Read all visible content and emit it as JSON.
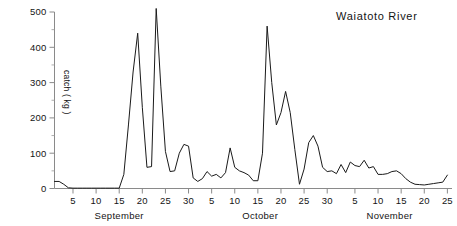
{
  "chart_data": {
    "type": "line",
    "title": "Waiatoto River",
    "xlabel": "",
    "ylabel": "catch ( kg )",
    "ylim": [
      0,
      500
    ],
    "yticks": [
      0,
      100,
      200,
      300,
      400,
      500
    ],
    "yticklabels": [
      "0",
      "100",
      "200",
      "300",
      "400",
      "500"
    ],
    "yminor_step": 50,
    "grid": false,
    "legend": null,
    "months": [
      {
        "name": "September",
        "days": 30
      },
      {
        "name": "October",
        "days": 31
      },
      {
        "name": "November",
        "days": 25
      }
    ],
    "xticklabels_september": [
      "5",
      "10",
      "15",
      "20",
      "25",
      "30"
    ],
    "xticklabels_october": [
      "5",
      "10",
      "15",
      "20",
      "25",
      "30"
    ],
    "xticklabels_november": [
      "5",
      "10",
      "15",
      "20",
      "25"
    ],
    "xtick_step_days": 5,
    "series": [
      {
        "name": "catch",
        "x": [
          1,
          2,
          3,
          4,
          5,
          6,
          7,
          8,
          9,
          10,
          11,
          12,
          13,
          14,
          15,
          16,
          17,
          18,
          19,
          20,
          21,
          22,
          23,
          24,
          25,
          26,
          27,
          28,
          29,
          30,
          31,
          32,
          33,
          34,
          35,
          36,
          37,
          38,
          39,
          40,
          41,
          42,
          43,
          44,
          45,
          46,
          47,
          48,
          49,
          50,
          51,
          52,
          53,
          54,
          55,
          56,
          57,
          58,
          59,
          60,
          61,
          62,
          63,
          64,
          65,
          66,
          67,
          68,
          69,
          70,
          71,
          72,
          73,
          74,
          75,
          76,
          77,
          78,
          79,
          80,
          81,
          82,
          83,
          84,
          85,
          86
        ],
        "values": [
          20,
          20,
          12,
          2,
          1,
          1,
          1,
          1,
          1,
          1,
          1,
          1,
          1,
          1,
          1,
          40,
          180,
          330,
          440,
          230,
          60,
          62,
          510,
          290,
          105,
          48,
          50,
          100,
          125,
          120,
          30,
          20,
          28,
          48,
          35,
          40,
          30,
          45,
          115,
          60,
          50,
          45,
          38,
          22,
          22,
          100,
          460,
          300,
          180,
          215,
          275,
          215,
          110,
          12,
          55,
          130,
          150,
          120,
          60,
          48,
          50,
          42,
          68,
          45,
          75,
          65,
          62,
          80,
          58,
          62,
          40,
          40,
          42,
          48,
          50,
          42,
          28,
          18,
          12,
          11,
          10,
          12,
          14,
          16,
          18,
          38
        ]
      }
    ]
  },
  "axis": {
    "y_title": "catch ( kg )",
    "tick_label_color": "#141414"
  }
}
